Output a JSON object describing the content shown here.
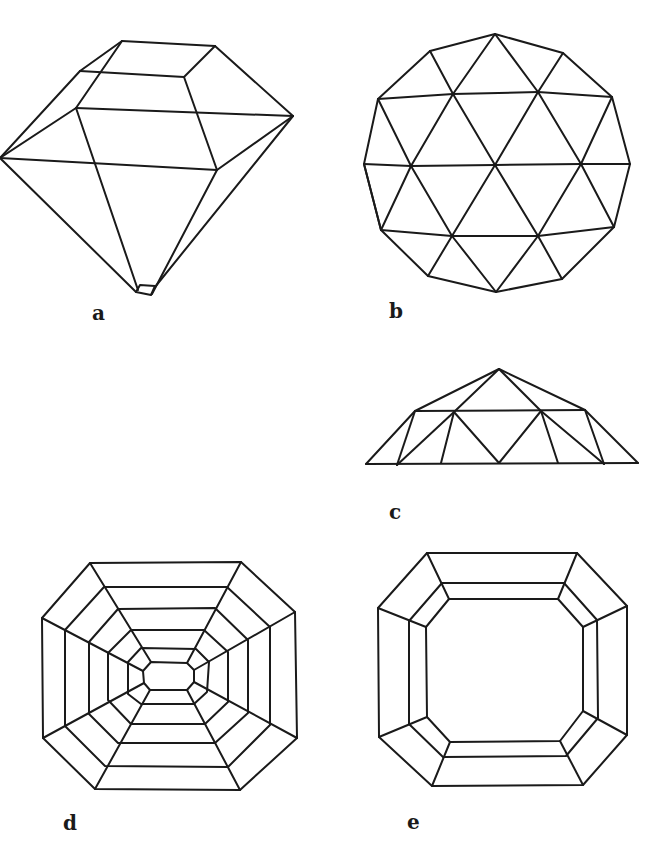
{
  "figure": {
    "stroke_color": "#1a1a1a",
    "stroke_width": 2,
    "panels": [
      {
        "id": "a",
        "label": "a",
        "label_pos": [
          92,
          303
        ],
        "description": "brilliant-cut gemstone in perspective view",
        "lines": [
          [
            122,
            41,
            215,
            46
          ],
          [
            122,
            41,
            80,
            71
          ],
          [
            80,
            71,
            184,
            77
          ],
          [
            215,
            46,
            184,
            77
          ],
          [
            122,
            41,
            76,
            108
          ],
          [
            80,
            71,
            0,
            158
          ],
          [
            76,
            108,
            0,
            158
          ],
          [
            76,
            108,
            293,
            116
          ],
          [
            215,
            46,
            293,
            116
          ],
          [
            184,
            77,
            217,
            170
          ],
          [
            0,
            158,
            217,
            170
          ],
          [
            217,
            170,
            293,
            116
          ],
          [
            76,
            108,
            138,
            290
          ],
          [
            0,
            158,
            136,
            292
          ],
          [
            217,
            170,
            152,
            294
          ],
          [
            293,
            116,
            155,
            287
          ]
        ],
        "polygons": [
          [
            [
              136,
              292
            ],
            [
              140,
              285
            ],
            [
              155,
              286
            ],
            [
              151,
              295
            ]
          ]
        ]
      },
      {
        "id": "b",
        "label": "b",
        "label_pos": [
          389,
          301
        ],
        "description": "top view of round faceted gem",
        "polygons": [
          [
            [
              495,
              34
            ],
            [
              563,
              53
            ],
            [
              612,
              97
            ],
            [
              630,
              164
            ],
            [
              614,
              227
            ],
            [
              562,
              279
            ],
            [
              496,
              292
            ],
            [
              428,
              276
            ],
            [
              381,
              230
            ],
            [
              364,
              164
            ],
            [
              378,
              99
            ],
            [
              430,
              51
            ]
          ]
        ],
        "lines": [
          [
            378,
            99,
            453,
            94
          ],
          [
            453,
            94,
            538,
            92
          ],
          [
            538,
            92,
            612,
            97
          ],
          [
            364,
            164,
            411,
            166
          ],
          [
            411,
            166,
            495,
            165
          ],
          [
            495,
            165,
            581,
            164
          ],
          [
            581,
            164,
            630,
            164
          ],
          [
            381,
            230,
            452,
            236
          ],
          [
            452,
            236,
            538,
            236
          ],
          [
            538,
            236,
            614,
            227
          ],
          [
            495,
            34,
            453,
            94
          ],
          [
            495,
            34,
            538,
            92
          ],
          [
            430,
            51,
            453,
            94
          ],
          [
            563,
            53,
            538,
            92
          ],
          [
            378,
            99,
            411,
            166
          ],
          [
            453,
            94,
            411,
            166
          ],
          [
            453,
            94,
            495,
            165
          ],
          [
            538,
            92,
            495,
            165
          ],
          [
            538,
            92,
            581,
            164
          ],
          [
            612,
            97,
            581,
            164
          ],
          [
            364,
            164,
            381,
            230
          ],
          [
            411,
            166,
            381,
            230
          ],
          [
            411,
            166,
            452,
            236
          ],
          [
            495,
            165,
            452,
            236
          ],
          [
            495,
            165,
            538,
            236
          ],
          [
            581,
            164,
            538,
            236
          ],
          [
            581,
            164,
            614,
            227
          ],
          [
            452,
            236,
            428,
            276
          ],
          [
            452,
            236,
            496,
            292
          ],
          [
            538,
            236,
            496,
            292
          ],
          [
            538,
            236,
            562,
            279
          ]
        ]
      },
      {
        "id": "c",
        "label": "c",
        "label_pos": [
          389,
          502
        ],
        "description": "side view of rose-cut gem",
        "lines": [
          [
            366,
            464,
            638,
            463
          ],
          [
            366,
            464,
            415,
            411
          ],
          [
            415,
            411,
            499,
            369
          ],
          [
            499,
            369,
            585,
            410
          ],
          [
            585,
            410,
            638,
            463
          ],
          [
            415,
            411,
            585,
            410
          ],
          [
            499,
            369,
            454,
            412
          ],
          [
            499,
            369,
            541,
            411
          ],
          [
            415,
            411,
            397,
            465
          ],
          [
            454,
            412,
            397,
            465
          ],
          [
            454,
            412,
            441,
            463
          ],
          [
            454,
            412,
            499,
            463
          ],
          [
            541,
            411,
            499,
            463
          ],
          [
            541,
            411,
            558,
            463
          ],
          [
            541,
            411,
            604,
            464
          ],
          [
            585,
            410,
            604,
            464
          ]
        ]
      },
      {
        "id": "d",
        "label": "d",
        "label_pos": [
          63,
          813
        ],
        "description": "step-cut octagon with concentric rows",
        "rings": [
          [
            [
              90,
              563
            ],
            [
              241,
              562
            ],
            [
              295,
              612
            ],
            [
              297,
              738
            ],
            [
              240,
              790
            ],
            [
              95,
              789
            ],
            [
              43,
              738
            ],
            [
              42,
              618
            ]
          ],
          [
            [
              104,
              587
            ],
            [
              227,
              587
            ],
            [
              270,
              627
            ],
            [
              270,
              725
            ],
            [
              228,
              767
            ],
            [
              105,
              766
            ],
            [
              65,
              726
            ],
            [
              65,
              630
            ]
          ],
          [
            [
              118,
              609
            ],
            [
              215,
              608
            ],
            [
              248,
              640
            ],
            [
              248,
              713
            ],
            [
              215,
              743
            ],
            [
              118,
              743
            ],
            [
              89,
              714
            ],
            [
              89,
              642
            ]
          ],
          [
            [
              131,
              630
            ],
            [
              204,
              630
            ],
            [
              228,
              652
            ],
            [
              228,
              702
            ],
            [
              205,
              724
            ],
            [
              131,
              724
            ],
            [
              108,
              700
            ],
            [
              108,
              653
            ]
          ],
          [
            [
              141,
              648
            ],
            [
              196,
              649
            ],
            [
              209,
              662
            ],
            [
              207,
              692
            ],
            [
              194,
              704
            ],
            [
              141,
              704
            ],
            [
              128,
              694
            ],
            [
              128,
              662
            ]
          ],
          [
            [
              151,
              662
            ],
            [
              187,
              663
            ],
            [
              194,
              670
            ],
            [
              194,
              682
            ],
            [
              187,
              690
            ],
            [
              150,
              690
            ],
            [
              144,
              683
            ],
            [
              143,
              671
            ]
          ]
        ],
        "spokes": [
          [
            90,
            563,
            151,
            662
          ],
          [
            241,
            562,
            187,
            663
          ],
          [
            295,
            612,
            194,
            670
          ],
          [
            297,
            738,
            194,
            682
          ],
          [
            240,
            790,
            187,
            690
          ],
          [
            95,
            789,
            150,
            690
          ],
          [
            43,
            738,
            144,
            683
          ],
          [
            42,
            618,
            143,
            671
          ]
        ]
      },
      {
        "id": "e",
        "label": "e",
        "label_pos": [
          407,
          812
        ],
        "description": "emerald-cut octagon top view",
        "rings": [
          [
            [
              427,
              553
            ],
            [
              577,
              553
            ],
            [
              627,
              606
            ],
            [
              627,
              735
            ],
            [
              583,
              785
            ],
            [
              432,
              786
            ],
            [
              379,
              737
            ],
            [
              378,
              608
            ]
          ],
          [
            [
              442,
              583
            ],
            [
              564,
              583
            ],
            [
              597,
              620
            ],
            [
              598,
              718
            ],
            [
              566,
              756
            ],
            [
              443,
              757
            ],
            [
              409,
              724
            ],
            [
              409,
              621
            ]
          ],
          [
            [
              449,
              599
            ],
            [
              558,
              599
            ],
            [
              583,
              627
            ],
            [
              583,
              711
            ],
            [
              560,
              741
            ],
            [
              450,
              742
            ],
            [
              427,
              717
            ],
            [
              426,
              627
            ]
          ]
        ],
        "spokes": [
          [
            427,
            553,
            449,
            599
          ],
          [
            577,
            553,
            558,
            599
          ],
          [
            627,
            606,
            583,
            627
          ],
          [
            627,
            735,
            583,
            711
          ],
          [
            583,
            785,
            560,
            741
          ],
          [
            432,
            786,
            450,
            742
          ],
          [
            379,
            737,
            427,
            717
          ],
          [
            378,
            608,
            426,
            627
          ]
        ]
      }
    ]
  }
}
